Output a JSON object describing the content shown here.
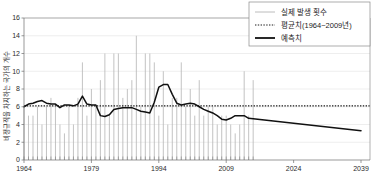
{
  "chart_data": {
    "type": "line",
    "title": "",
    "xlabel": "",
    "ylabel": "비정규직을 차지하는 국가의 개수",
    "xlim": [
      1964,
      2041
    ],
    "ylim": [
      0,
      16
    ],
    "ytick_labels": [
      "0",
      "2",
      "4",
      "6",
      "8",
      "10",
      "12",
      "14",
      "16"
    ],
    "ytick_values": [
      0,
      2,
      4,
      6,
      8,
      10,
      12,
      14,
      16
    ],
    "xtick_labels": [
      "1964",
      "1979",
      "1994",
      "2009",
      "2024",
      "2039"
    ],
    "xtick_values": [
      1964,
      1979,
      1994,
      2009,
      2024,
      2039
    ],
    "grid": true,
    "legend_position": "top-right",
    "mean_value": 6.1,
    "series": [
      {
        "name": "실제 발생 횟수",
        "type": "bar",
        "color": "#b4b4b4",
        "x": [
          1964,
          1965,
          1966,
          1967,
          1968,
          1969,
          1970,
          1971,
          1972,
          1973,
          1974,
          1975,
          1976,
          1977,
          1978,
          1979,
          1980,
          1981,
          1982,
          1983,
          1984,
          1985,
          1986,
          1987,
          1988,
          1989,
          1990,
          1991,
          1992,
          1993,
          1994,
          1995,
          1996,
          1997,
          1998,
          1999,
          2000,
          2001,
          2002,
          2003,
          2004,
          2005,
          2006,
          2007,
          2008,
          2009,
          2010,
          2011,
          2012,
          2013,
          2014,
          2015
        ],
        "values": [
          6,
          5,
          5,
          6,
          4,
          6,
          7,
          6,
          4,
          3,
          6,
          4,
          7,
          11,
          5,
          8,
          6,
          9,
          12,
          5,
          12,
          12,
          7,
          8,
          9,
          14,
          6,
          12,
          12,
          11,
          5,
          10,
          4,
          7,
          7,
          11,
          6,
          8,
          5,
          9,
          5,
          6,
          6,
          4,
          5,
          5,
          4,
          3,
          4,
          10,
          5,
          9
        ]
      },
      {
        "name": "평균치(1964~2009년)",
        "type": "line",
        "style": "dotted",
        "color": "#1a1a1a",
        "x": [
          1964,
          2041
        ],
        "values": [
          6.1,
          6.1
        ]
      },
      {
        "name": "예측치",
        "type": "line",
        "style": "solid",
        "color": "#111111",
        "x": [
          1964,
          1965,
          1966,
          1967,
          1968,
          1969,
          1970,
          1971,
          1972,
          1973,
          1974,
          1975,
          1976,
          1977,
          1978,
          1979,
          1980,
          1981,
          1982,
          1983,
          1984,
          1985,
          1986,
          1987,
          1988,
          1989,
          1990,
          1991,
          1992,
          1993,
          1994,
          1995,
          1996,
          1997,
          1998,
          1999,
          2000,
          2001,
          2002,
          2003,
          2004,
          2005,
          2006,
          2007,
          2008,
          2009,
          2010,
          2011,
          2012,
          2013,
          2014,
          2039
        ],
        "values": [
          6.0,
          6.3,
          6.4,
          6.6,
          6.7,
          6.4,
          6.3,
          6.3,
          5.9,
          6.2,
          6.2,
          6.1,
          6.3,
          7.2,
          6.3,
          6.2,
          6.2,
          5.0,
          4.9,
          5.1,
          5.7,
          5.8,
          5.9,
          5.9,
          5.9,
          5.7,
          5.5,
          5.4,
          5.3,
          6.5,
          8.2,
          8.5,
          8.5,
          7.4,
          6.4,
          6.2,
          6.3,
          6.4,
          6.3,
          6.0,
          5.7,
          5.5,
          5.3,
          5.0,
          4.6,
          4.5,
          4.7,
          5.0,
          5.0,
          5.0,
          4.7,
          3.3
        ]
      }
    ]
  },
  "legend": {
    "items": [
      {
        "label": "실제 발생 횟수",
        "marker": "thin-line"
      },
      {
        "label": "평균치(1964~2009년)",
        "marker": "dotted-line"
      },
      {
        "label": "예측치",
        "marker": "thick-line"
      }
    ]
  },
  "colors": {
    "bar": "#b4b4b4",
    "mean": "#1a1a1a",
    "prediction": "#111111",
    "grid": "#dcdcdc",
    "axis": "#6f6f6f",
    "background": "#ffffff"
  }
}
